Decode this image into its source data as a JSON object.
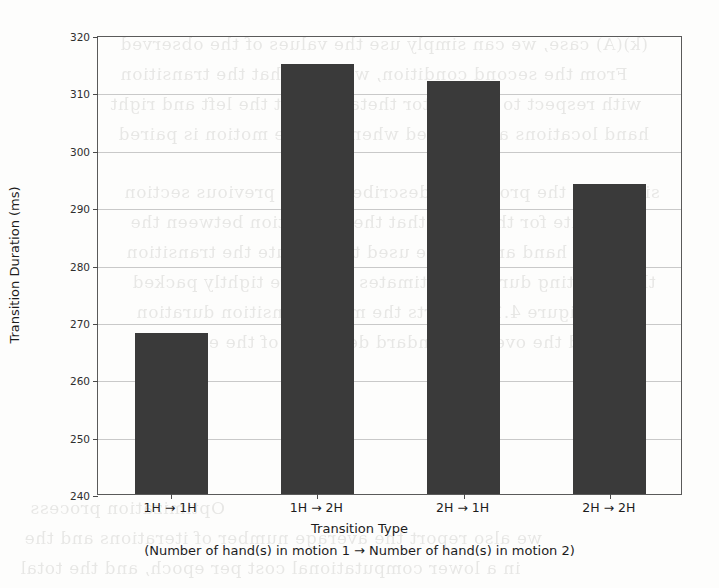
{
  "chart_data": {
    "type": "bar",
    "title": "",
    "categories": [
      "1H → 1H",
      "1H → 2H",
      "2H → 1H",
      "2H → 2H"
    ],
    "values": [
      268,
      315,
      312,
      294
    ],
    "xlabel": "Transition Type",
    "xlabel_sub": "(Number of hand(s) in motion 1 → Number of hand(s) in motion 2)",
    "ylabel": "Transition Duration (ms)",
    "ylim": [
      240,
      320
    ],
    "ytick_labels": [
      "320",
      "310",
      "300",
      "290",
      "280",
      "270",
      "260",
      "250",
      "240"
    ],
    "ytick_values": [
      320,
      310,
      300,
      290,
      280,
      270,
      260,
      250,
      240
    ],
    "ytick_step": 10,
    "grid": "horizontal",
    "legend": "none",
    "bar_color": "#3a3a3a",
    "grid_color": "#c9c9c9",
    "frame_color": "#5a5a5a",
    "background_color": "#fdfdfc"
  },
  "background_text": {
    "note": "faint bleed-through text from reverse side of scanned page",
    "lines": [
      "(k)(A) case, we can simply use the values of the observed",
      "From the second condition, we have that the transition",
      "with respect to the vector theta, so that the left and right",
      "hand locations are aligned whenever the motion is paired",
      "similar to the procedure described in the previous section",
      "evaluate for the basis that the separation between the",
      "left hand and can be used to compute the transition",
      "the resulting duration estimates are more tightly packed",
      "in Figure 4.15 reports the mean transition duration",
      "and the overall standard deviation of the estimate",
      "Optimization process",
      "we also report the average number of iterations and the",
      "in a lower computational cost per epoch, and the total"
    ]
  }
}
